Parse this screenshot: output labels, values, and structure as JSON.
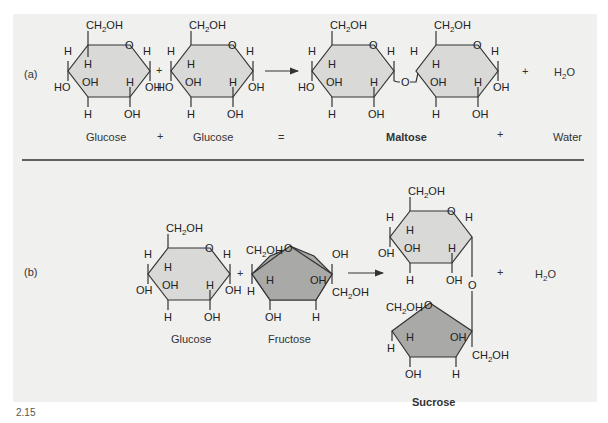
{
  "figure_number": "2.15",
  "part_a": {
    "label": "(a)",
    "reactant1": "Glucose",
    "reactant2": "Glucose",
    "plus1": "+",
    "equals": "=",
    "product": "Maltose",
    "plus2": "+",
    "byproduct": "Water",
    "byproduct_formula_main": "H",
    "byproduct_formula_sub": "2",
    "byproduct_formula_end": "O"
  },
  "part_b": {
    "label": "(b)",
    "reactant1": "Glucose",
    "reactant2": "Fructose",
    "product": "Sucrose",
    "plus": "+",
    "byproduct_formula_main": "H",
    "byproduct_formula_sub": "2",
    "byproduct_formula_end": "O"
  },
  "atoms": {
    "ch2oh_c": "CH",
    "ch2oh_sub": "2",
    "ch2oh_oh": "OH",
    "o": "O",
    "h": "H",
    "oh": "OH",
    "ho": "HO"
  },
  "colors": {
    "panel": "#f0f0ef",
    "glucose_ring": "#d9d9d7",
    "fructose_ring": "#a9a9a7",
    "line": "#333333"
  }
}
